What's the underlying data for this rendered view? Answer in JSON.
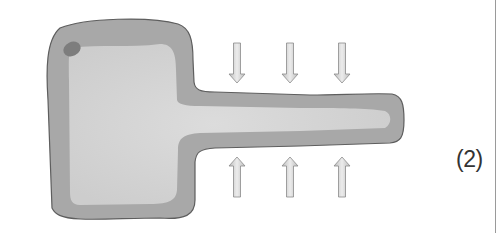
{
  "figure": {
    "label": "(2)",
    "colors": {
      "outline": "#5e5e5e",
      "outer_fill": "#a8a8a8",
      "inner_fill": "#d4d4d4",
      "spot": "#7d7d7d",
      "arrow_fill": "#d8d8d8",
      "arrow_stroke": "#8a8a8a"
    },
    "arrows": {
      "down": [
        {
          "x": 237
        },
        {
          "x": 290
        },
        {
          "x": 342
        }
      ],
      "up": [
        {
          "x": 237
        },
        {
          "x": 290
        },
        {
          "x": 342
        }
      ]
    }
  }
}
